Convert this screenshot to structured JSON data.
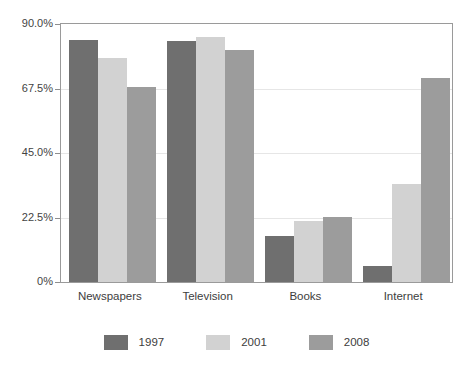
{
  "chart_data": {
    "type": "bar",
    "title": "",
    "subtitle": "",
    "xlabel": "",
    "ylabel": "",
    "categories": [
      "Newspapers",
      "Television",
      "Books",
      "Internet"
    ],
    "series": [
      {
        "name": "1997",
        "color": "#6f6f6f",
        "values": [
          84.4,
          84.1,
          16.0,
          5.6
        ]
      },
      {
        "name": "2001",
        "color": "#d2d2d2",
        "values": [
          78.2,
          85.5,
          21.2,
          34.1
        ]
      },
      {
        "name": "2008",
        "color": "#9c9c9c",
        "values": [
          68.1,
          81.0,
          22.6,
          71.2
        ]
      }
    ],
    "ylim": [
      0,
      90
    ],
    "yticks": [
      0,
      22.5,
      45,
      67.5,
      90
    ],
    "ytick_labels": [
      "0%",
      "22.5%",
      "45.0%",
      "67.5%",
      "90.0%"
    ],
    "grid": true,
    "legend_position": "bottom",
    "bar_style": "grouped"
  },
  "axis": {
    "y_ticks": [
      {
        "label": "90.0%",
        "value": 90
      },
      {
        "label": "67.5%",
        "value": 67.5
      },
      {
        "label": "45.0%",
        "value": 45
      },
      {
        "label": "22.5%",
        "value": 22.5
      },
      {
        "label": "0%",
        "value": 0
      }
    ]
  },
  "legend": {
    "items": [
      {
        "label": "1997",
        "color": "#6f6f6f"
      },
      {
        "label": "2001",
        "color": "#d2d2d2"
      },
      {
        "label": "2008",
        "color": "#9c9c9c"
      }
    ]
  }
}
